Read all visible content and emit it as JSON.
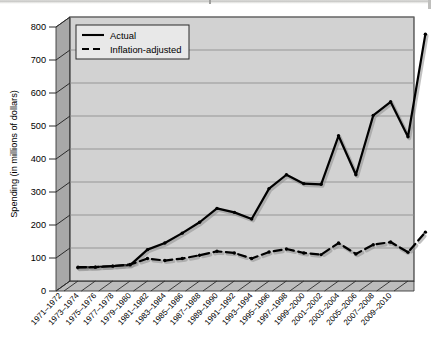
{
  "chart_data": {
    "type": "line",
    "title": "",
    "xlabel": "",
    "ylabel": "Spending (in millions of dollars)",
    "ylim": [
      0,
      800
    ],
    "ytick_values": [
      0,
      100,
      200,
      300,
      400,
      500,
      600,
      700,
      800
    ],
    "ytick_labels": [
      "0",
      "100",
      "200",
      "300",
      "400",
      "500",
      "600",
      "700",
      "800"
    ],
    "grid": true,
    "grid_axis": "y",
    "legend_position": "upper-left-inside",
    "style": "3d-wall",
    "categories": [
      "1971–1972",
      "1973–1974",
      "1975–1976",
      "1977–1978",
      "1979–1980",
      "1981–1982",
      "1983–1984",
      "1985–1986",
      "1987–1988",
      "1989–1990",
      "1991–1992",
      "1993–1994",
      "1995–1996",
      "1997–1998",
      "1999–2000",
      "2001–2002",
      "2003–2004",
      "2005–2006",
      "2007–2008",
      "2009–2010"
    ],
    "series": [
      {
        "name": "Actual",
        "line_style": "solid",
        "color": "#000000",
        "marker": "dot",
        "values": [
          40,
          42,
          45,
          48,
          95,
          115,
          145,
          178,
          220,
          208,
          188,
          280,
          322,
          295,
          293,
          440,
          322,
          502,
          543,
          437
        ]
      },
      {
        "name": "Inflation-adjusted",
        "line_style": "dashed",
        "color": "#000000",
        "marker": "dot",
        "values": [
          42,
          42,
          45,
          50,
          68,
          62,
          68,
          78,
          90,
          85,
          68,
          88,
          97,
          85,
          80,
          115,
          82,
          110,
          118,
          87
        ]
      }
    ],
    "final_point_note": {
      "series": "Actual",
      "category": "2009–2010",
      "value": 748
    },
    "final_point_note_2": {
      "series": "Inflation-adjusted",
      "category": "2009–2010",
      "value": 148
    }
  },
  "legend": {
    "items": [
      {
        "label": "Actual",
        "style": "solid"
      },
      {
        "label": "Inflation-adjusted",
        "style": "dashed"
      }
    ]
  },
  "colors": {
    "plot_face": "#d2d2d2",
    "left_wall": "#a8a8a8",
    "floor": "#bdbdbd",
    "gridline": "#8c8c8c",
    "line": "#000000",
    "frame": "#2b2b2b",
    "legend_bg": "#e6e6e6"
  },
  "axis": {
    "y_label": "Spending (in millions of dollars)"
  }
}
